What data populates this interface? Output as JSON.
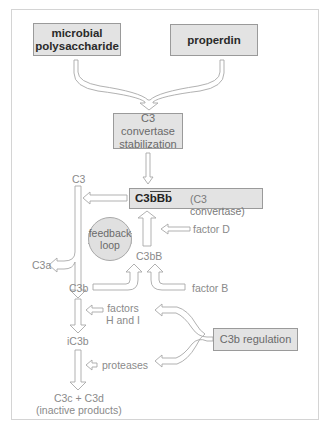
{
  "diagram": {
    "colors": {
      "box_fill": "#e3e3e3",
      "box_border": "#9a9a9a",
      "arrow_stroke": "#b0b0b0",
      "text_dark": "#2a2a2a",
      "text_light": "#8a8a8a"
    },
    "boxes": {
      "microbial": [
        "microbial",
        "polysaccharide"
      ],
      "properdin": "properdin",
      "stabilization": [
        "C3 convertase",
        "stabilization"
      ],
      "convertase_name": "C3bBb",
      "convertase_desc": "(C3 convertase)",
      "regulation": "C3b regulation"
    },
    "feedback_loop": [
      "feedback",
      "loop"
    ],
    "labels": {
      "c3": "C3",
      "c3a": "C3a",
      "c3b": "C3b",
      "c3bB": "C3bB",
      "factor_d": "factor D",
      "factor_b": "factor B",
      "factors_hi": [
        "factors",
        "H and I"
      ],
      "ic3b": "iC3b",
      "proteases": "proteases",
      "products": [
        "C3c + C3d",
        "(inactive products)"
      ]
    },
    "flows": [
      {
        "from": "microbial polysaccharide",
        "to": "C3 convertase stabilization"
      },
      {
        "from": "properdin",
        "to": "C3 convertase stabilization"
      },
      {
        "from": "C3 convertase stabilization",
        "to": "C3bBb"
      },
      {
        "from": "C3bBb",
        "to": "C3",
        "note": "cleaves"
      },
      {
        "from": "C3",
        "to": "C3a"
      },
      {
        "from": "C3",
        "to": "C3b"
      },
      {
        "from": "C3b",
        "to": "C3bB"
      },
      {
        "from": "factor B",
        "to": "C3bB"
      },
      {
        "from": "C3bB",
        "to": "C3bBb"
      },
      {
        "from": "factor D",
        "to": "C3bB→C3bBb"
      },
      {
        "from": "C3b",
        "to": "iC3b",
        "via": "factors H and I"
      },
      {
        "from": "iC3b",
        "to": "C3c + C3d",
        "via": "proteases"
      },
      {
        "from": "C3b regulation",
        "to": "factors H and I"
      },
      {
        "from": "C3b regulation",
        "to": "proteases"
      }
    ]
  }
}
